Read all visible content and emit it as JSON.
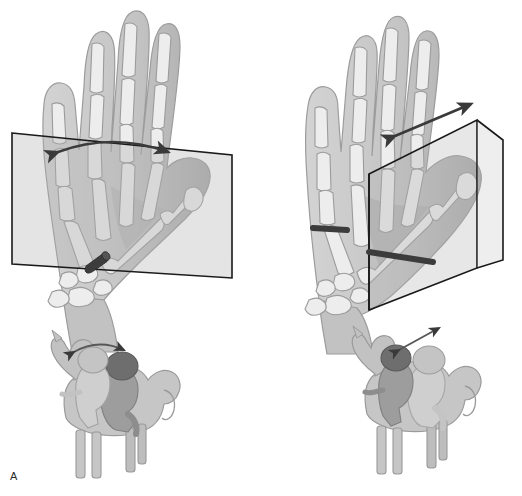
{
  "figure": {
    "background_color": "#ffffff",
    "style": "grayscale anatomical line illustration",
    "width": 522,
    "height": 496
  },
  "palette": {
    "background": "#ffffff",
    "skin_light": "#c9c9c9",
    "skin_mid": "#b4b4b4",
    "skin_shadow": "#a0a0a0",
    "bone_light": "#efefef",
    "bone_mid": "#e0e0e0",
    "bone_outline": "#8f8f8f",
    "plane_fill": "#b0b0b0",
    "plane_stroke": "#1a1a1a",
    "arrow": "#3a3a3a",
    "rod_dark": "#3c3c3c",
    "helmet_dark": "#6e6e6e",
    "helmet_light": "#c4c4c4",
    "horse_body": "#c6c6c6",
    "horse_outline": "#9a9a9a",
    "rider_dark": "#9d9d9d",
    "rider_light": "#cfcfcf",
    "label_text": "#2b2b2b"
  },
  "panels": [
    {
      "id": "A",
      "label": "A",
      "label_x": 10,
      "label_y": 470,
      "hand": {
        "view": "palmar view of right hand, fingers extended upward, thumb abducted to the radial side",
        "bones_visible": [
          "distal phalanges",
          "middle phalanges",
          "proximal phalanges",
          "metacarpals",
          "carpals",
          "thumb distal phalanx",
          "thumb proximal phalanx",
          "thumb metacarpal",
          "trapezium"
        ]
      },
      "plane": {
        "shape": "rectangle",
        "orientation": "plane of the palm, lying flat in the page, slightly tilted",
        "description": "transparent rectangular plane overlaying the palm and thumb"
      },
      "motion_arrow": {
        "style": "curved double-headed arrow",
        "arc_direction": "bowed upward",
        "meaning": "palmar abduction arc of the thumb within the plane of the palm"
      },
      "rod": {
        "style": "short dark cylindrical rod seen end-on, foreshortened",
        "location": "thumb carpometacarpal joint region",
        "meaning": "axis of rotation pointing toward the viewer"
      }
    },
    {
      "id": "B",
      "label": "B",
      "label_x": 348,
      "label_y": 470,
      "hand": {
        "view": "palmar view of right hand, fingers extended upward, thumb elevated out of the plane of the palm",
        "bones_visible": [
          "distal phalanges",
          "middle phalanges",
          "proximal phalanges",
          "metacarpals",
          "carpals",
          "thumb distal phalanx",
          "thumb proximal phalanx",
          "thumb metacarpal",
          "trapezium"
        ]
      },
      "plane": {
        "shape": "parallelogram",
        "orientation": "plane perpendicular to the palm, receding into the page",
        "description": "transparent oblique plane standing up out of the palm along the thumb ray"
      },
      "motion_arrow": {
        "style": "straight double-headed arrow",
        "direction": "diagonal, lower-left to upper-right",
        "meaning": "radial abduction / opposition excursion perpendicular to the palm"
      },
      "rod": {
        "style": "two thick dark rod segments in line, crossing the plane",
        "location": "through the thumb metacarpal base and across the plane edge",
        "meaning": "axis of rotation lying in the plane of the palm"
      }
    }
  ],
  "mnemonics": [
    {
      "panel": "A",
      "scene": "horse and rider",
      "horse": {
        "facing": "left",
        "legs": 4,
        "pose": "standing"
      },
      "riders": [
        {
          "position": "front",
          "helmet": "light",
          "note": "start position"
        },
        {
          "position": "rear",
          "helmet": "dark",
          "note": "end position"
        }
      ],
      "arrow": {
        "style": "curved double-headed arrow",
        "placement": "arcing between the two helmets",
        "meaning": "arc of motion matching panel A"
      }
    },
    {
      "panel": "B",
      "scene": "horse and rider",
      "horse": {
        "facing": "left",
        "legs": 4,
        "pose": "standing"
      },
      "riders": [
        {
          "position": "front",
          "helmet": "dark",
          "note": "start position"
        },
        {
          "position": "rear",
          "helmet": "light",
          "note": "end position"
        }
      ],
      "arrow": {
        "style": "straight double-headed arrow",
        "placement": "diagonal above and between the two helmets",
        "meaning": "linear excursion matching panel B"
      }
    }
  ]
}
